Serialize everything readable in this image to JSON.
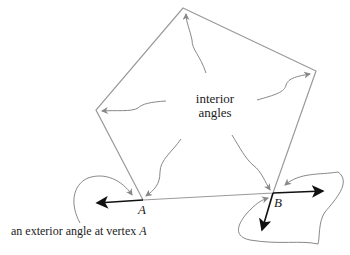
{
  "diagram": {
    "center_label_line1": "interior",
    "center_label_line2": "angles",
    "vertex_a": "A",
    "vertex_b": "B",
    "caption_prefix": "an exterior angle at vertex ",
    "caption_vertex": "A",
    "colors": {
      "polygon": "#999999",
      "arrows": "#888888",
      "rays": "#111111"
    }
  }
}
